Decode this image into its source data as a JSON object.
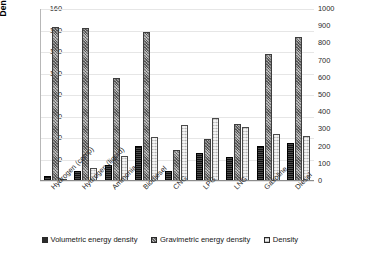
{
  "chart_data": {
    "type": "bar",
    "title": "",
    "xlabel": "",
    "categories": [
      "Hydrogen (comp)",
      "Hydrogen (liquid)",
      "Ammonia",
      "Biodiesel",
      "CNG",
      "LPG",
      "LNG",
      "Gasoline",
      "Diesel"
    ],
    "series": [
      {
        "name": "Volumetric energy density",
        "axis": "right",
        "unit": "MJ/l",
        "values": [
          5,
          8,
          14,
          33,
          9,
          26,
          22,
          34,
          36
        ]
      },
      {
        "name": "Gravimetric energy density",
        "axis": "right",
        "unit": "MJ/kg",
        "values": [
          120,
          120,
          18.6,
          38,
          53,
          46,
          55,
          46,
          45
        ]
      },
      {
        "name": "Density",
        "axis": "left",
        "unit": "kg/m3",
        "values": [
          0.9,
          11,
          23,
          41,
          52,
          59,
          50,
          44,
          42
        ]
      }
    ],
    "plotted_series": [
      {
        "name": "Volumetric energy density",
        "pattern": "solid-dark",
        "right_axis_values": [
          5,
          8,
          14,
          33,
          9,
          26,
          22,
          34,
          36
        ]
      },
      {
        "name": "Gravimetric energy density",
        "pattern": "dense-speckle",
        "right_axis_values": [
          890,
          885,
          600,
          870,
          0,
          0,
          0,
          740,
          850
        ]
      },
      {
        "name": "Density",
        "pattern": "light-stipple",
        "left_axis_values": [
          0.9,
          11,
          23,
          41,
          52,
          59,
          50,
          44,
          42
        ]
      }
    ],
    "left_axis": {
      "label": "Density (kg/m³)",
      "min": 0,
      "max": 160,
      "step": 20,
      "ticks": [
        "0",
        "20",
        "40",
        "60",
        "80",
        "100",
        "120",
        "140",
        "160"
      ]
    },
    "right_axis": {
      "label": "Volumetric (MJ/l) and gravimetric (MJ/kg) energy densities",
      "min": 0,
      "max": 1000,
      "step": 100,
      "ticks": [
        "0",
        "100",
        "200",
        "300",
        "400",
        "500",
        "600",
        "700",
        "800",
        "900",
        "1000"
      ]
    },
    "legend": {
      "position": "bottom",
      "entries": [
        {
          "label": "Volumetric energy density",
          "swatch": "dark"
        },
        {
          "label": "Gravimetric energy density",
          "swatch": "gray-speckle"
        },
        {
          "label": "Density",
          "swatch": "light"
        }
      ]
    },
    "grid": true,
    "bars": [
      {
        "category": "Hydrogen (comp)",
        "volumetric": 5,
        "gravimetric": 143,
        "density": 1
      },
      {
        "category": "Hydrogen (liquid)",
        "volumetric": 9,
        "gravimetric": 142,
        "density": 12
      },
      {
        "category": "Ammonia",
        "volumetric": 15,
        "gravimetric": 96,
        "density": 23
      },
      {
        "category": "Biodiesel",
        "volumetric": 33,
        "gravimetric": 139,
        "density": 41
      },
      {
        "category": "CNG",
        "volumetric": 9,
        "gravimetric": 29,
        "density": 52
      },
      {
        "category": "LPG",
        "volumetric": 26,
        "gravimetric": 39,
        "density": 59
      },
      {
        "category": "LNG",
        "volumetric": 22,
        "gravimetric": 53,
        "density": 50
      },
      {
        "category": "Gasoline",
        "volumetric": 33,
        "gravimetric": 118,
        "density": 44
      },
      {
        "category": "Diesel",
        "volumetric": 35,
        "gravimetric": 134,
        "density": 42
      }
    ],
    "bar_scale_max": 160,
    "colors": {
      "volumetric": "#2b2b2b",
      "gravimetric": "#8e8e8e",
      "density": "#d7d7d7",
      "gridline": "#e6e6e6",
      "axis": "#8c8c8c",
      "text": "#1a1a1a"
    }
  }
}
